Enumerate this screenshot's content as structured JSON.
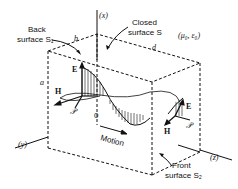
{
  "diagram": {
    "axes": {
      "x": "(x)",
      "y": "(y)",
      "z": "(z)"
    },
    "origin": "0",
    "dimensions": {
      "a": "a",
      "b": "b",
      "d": "d"
    },
    "labels": {
      "back_surface_line1": "Back",
      "back_surface_line2": "surface S₁",
      "closed_surface_line1": "Closed",
      "closed_surface_line2": "surface S",
      "medium": "(μ₀, ε₀)",
      "front_surface_line1": "Front",
      "front_surface_line2": "surface S₂",
      "motion": "Motion"
    },
    "vectors": {
      "E_left": "E",
      "H_left": "H",
      "P_left": "𝒫",
      "E_right": "E",
      "H_right": "H",
      "P_right": "𝒫"
    }
  }
}
